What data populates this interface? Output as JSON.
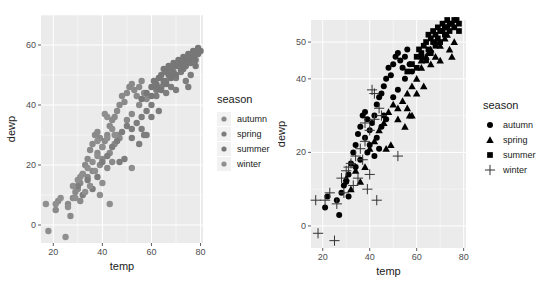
{
  "chart_data": [
    {
      "type": "scatter",
      "title": "",
      "xlabel": "temp",
      "ylabel": "dewp",
      "xlim": [
        15,
        81
      ],
      "ylim": [
        -6,
        70
      ],
      "xticks": [
        20,
        40,
        60,
        80
      ],
      "yticks": [
        0,
        20,
        40,
        60
      ],
      "grid": true,
      "legend_position": "right",
      "legend_title": "season",
      "aesthetic": "color",
      "series": [
        {
          "name": "autumn",
          "color": "#8a8a8a",
          "shape": "circle"
        },
        {
          "name": "spring",
          "color": "#7d7d7d",
          "shape": "circle"
        },
        {
          "name": "summer",
          "color": "#777777",
          "shape": "circle"
        },
        {
          "name": "winter",
          "color": "#8f8f8f",
          "shape": "circle"
        }
      ]
    },
    {
      "type": "scatter",
      "title": "",
      "xlabel": "temp",
      "ylabel": "dewp",
      "xlim": [
        15,
        81
      ],
      "ylim": [
        -6,
        56
      ],
      "xticks": [
        20,
        40,
        60,
        80
      ],
      "yticks": [
        0,
        20,
        40,
        50
      ],
      "grid": true,
      "legend_position": "right",
      "legend_title": "season",
      "aesthetic": "shape",
      "series": [
        {
          "name": "autumn",
          "color": "#000000",
          "shape": "circle"
        },
        {
          "name": "spring",
          "color": "#000000",
          "shape": "triangle"
        },
        {
          "name": "summer",
          "color": "#000000",
          "shape": "square"
        },
        {
          "name": "winter",
          "color": "#000000",
          "shape": "plus"
        }
      ]
    }
  ],
  "points": {
    "autumn": [
      [
        21,
        5
      ],
      [
        22,
        8
      ],
      [
        26,
        7
      ],
      [
        27,
        3
      ],
      [
        28,
        9
      ],
      [
        29,
        11
      ],
      [
        30,
        12
      ],
      [
        31,
        14
      ],
      [
        32,
        17
      ],
      [
        33,
        20
      ],
      [
        34,
        22
      ],
      [
        35,
        25
      ],
      [
        36,
        27
      ],
      [
        37,
        30
      ],
      [
        38,
        31
      ],
      [
        39,
        29
      ],
      [
        40,
        26
      ],
      [
        41,
        28
      ],
      [
        42,
        30
      ],
      [
        43,
        33
      ],
      [
        44,
        35
      ],
      [
        45,
        36
      ],
      [
        46,
        38
      ],
      [
        47,
        40
      ],
      [
        48,
        43
      ],
      [
        49,
        41
      ],
      [
        50,
        44
      ],
      [
        51,
        46
      ],
      [
        52,
        47
      ],
      [
        53,
        45
      ],
      [
        54,
        43
      ],
      [
        55,
        46
      ],
      [
        56,
        48
      ],
      [
        57,
        44
      ],
      [
        38,
        24
      ],
      [
        39,
        20
      ],
      [
        40,
        22
      ],
      [
        42,
        19
      ],
      [
        43,
        24
      ],
      [
        45,
        27
      ],
      [
        46,
        30
      ],
      [
        36,
        18
      ],
      [
        34,
        16
      ],
      [
        31,
        8
      ],
      [
        44,
        21
      ],
      [
        47,
        29
      ],
      [
        50,
        35
      ],
      [
        52,
        37
      ],
      [
        55,
        40
      ],
      [
        58,
        42
      ]
    ],
    "spring": [
      [
        30,
        13
      ],
      [
        32,
        10
      ],
      [
        34,
        15
      ],
      [
        36,
        12
      ],
      [
        38,
        16
      ],
      [
        40,
        21
      ],
      [
        42,
        23
      ],
      [
        44,
        26
      ],
      [
        46,
        28
      ],
      [
        48,
        31
      ],
      [
        50,
        33
      ],
      [
        52,
        32
      ],
      [
        54,
        34
      ],
      [
        56,
        36
      ],
      [
        58,
        38
      ],
      [
        60,
        40
      ],
      [
        62,
        43
      ],
      [
        64,
        46
      ],
      [
        66,
        48
      ],
      [
        68,
        50
      ],
      [
        70,
        49
      ],
      [
        72,
        51
      ],
      [
        74,
        48
      ],
      [
        75,
        46
      ],
      [
        58,
        30
      ],
      [
        56,
        32
      ],
      [
        52,
        29
      ],
      [
        49,
        22
      ],
      [
        47,
        21
      ],
      [
        55,
        27
      ],
      [
        57,
        30
      ],
      [
        60,
        36
      ],
      [
        63,
        38
      ],
      [
        66,
        44
      ],
      [
        70,
        45
      ],
      [
        73,
        52
      ],
      [
        76,
        50
      ],
      [
        62,
        45
      ],
      [
        65,
        47
      ],
      [
        68,
        46
      ]
    ],
    "summer": [
      [
        56,
        42
      ],
      [
        58,
        44
      ],
      [
        60,
        46
      ],
      [
        61,
        48
      ],
      [
        62,
        47
      ],
      [
        63,
        49
      ],
      [
        64,
        50
      ],
      [
        65,
        52
      ],
      [
        66,
        51
      ],
      [
        67,
        53
      ],
      [
        68,
        52
      ],
      [
        69,
        54
      ],
      [
        70,
        53
      ],
      [
        71,
        55
      ],
      [
        72,
        54
      ],
      [
        73,
        56
      ],
      [
        74,
        55
      ],
      [
        75,
        57
      ],
      [
        76,
        56
      ],
      [
        77,
        58
      ],
      [
        78,
        57
      ],
      [
        79,
        59
      ],
      [
        80,
        58
      ],
      [
        64,
        45
      ],
      [
        66,
        47
      ],
      [
        68,
        49
      ],
      [
        70,
        50
      ],
      [
        72,
        52
      ],
      [
        74,
        53
      ],
      [
        76,
        54
      ],
      [
        78,
        55
      ],
      [
        60,
        43
      ],
      [
        62,
        46
      ],
      [
        65,
        48
      ],
      [
        67,
        50
      ],
      [
        69,
        51
      ],
      [
        71,
        53
      ],
      [
        73,
        54
      ],
      [
        75,
        55
      ],
      [
        77,
        56
      ],
      [
        79,
        57
      ],
      [
        78,
        53
      ]
    ],
    "winter": [
      [
        17,
        7
      ],
      [
        18,
        -2
      ],
      [
        21,
        7
      ],
      [
        23,
        9
      ],
      [
        25,
        -4
      ],
      [
        26,
        6
      ],
      [
        28,
        13
      ],
      [
        30,
        15
      ],
      [
        32,
        17
      ],
      [
        34,
        19
      ],
      [
        36,
        21
      ],
      [
        38,
        23
      ],
      [
        39,
        10
      ],
      [
        40,
        26
      ],
      [
        41,
        37
      ],
      [
        42,
        29
      ],
      [
        43,
        7
      ],
      [
        44,
        32
      ],
      [
        45,
        30
      ],
      [
        52,
        19
      ],
      [
        35,
        13
      ],
      [
        33,
        11
      ],
      [
        29,
        9
      ],
      [
        31,
        16
      ],
      [
        37,
        18
      ],
      [
        40,
        14
      ],
      [
        42,
        36
      ],
      [
        38,
        28
      ]
    ]
  }
}
